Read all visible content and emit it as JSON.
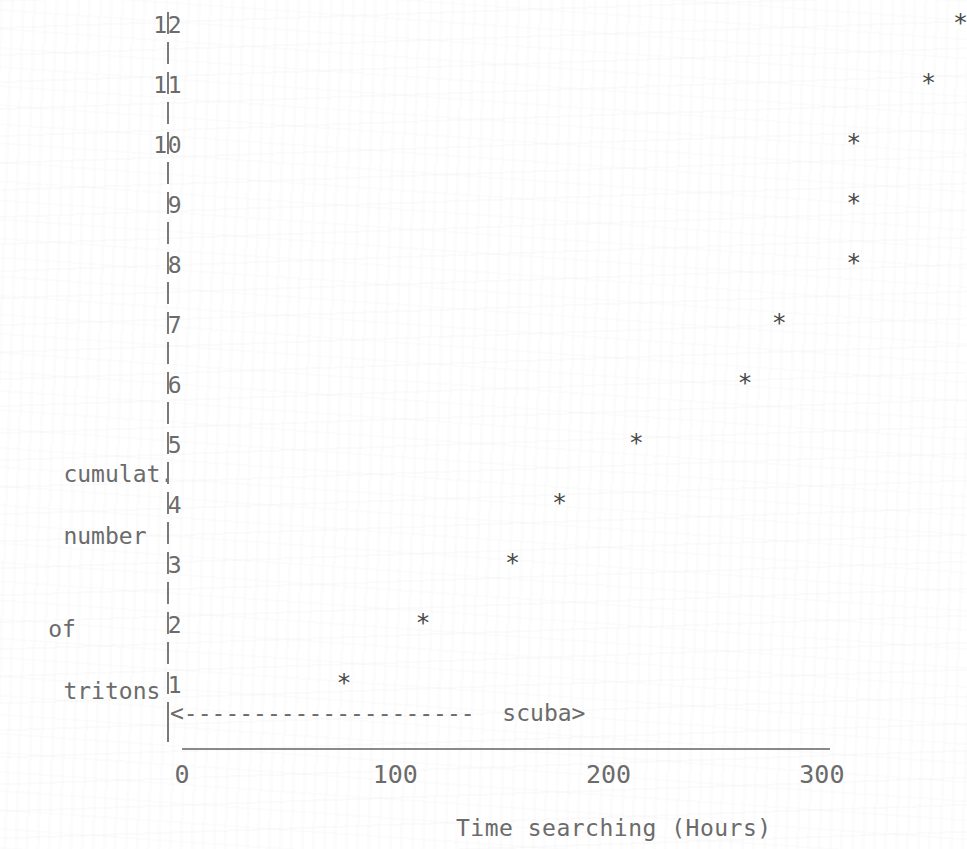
{
  "figure": {
    "background_color": "#ffffff",
    "ink_color": "#6b6b6b",
    "marker_glyph": "*",
    "axis_glyph": "|"
  },
  "y_axis": {
    "title_lines": [
      "cumulat.",
      "number",
      "of",
      "tritons"
    ],
    "tick_labels": [
      "12",
      "11",
      "10",
      "9",
      "8",
      "7",
      "6",
      "5",
      "4",
      "3",
      "2",
      "1"
    ]
  },
  "x_axis": {
    "title": "Time searching (Hours)",
    "tick_labels": [
      "0",
      "100",
      "200",
      "300"
    ]
  },
  "annotation": {
    "arrow": "<---------------------",
    "label": "scuba>"
  },
  "chart_data": {
    "type": "scatter",
    "title": "",
    "xlabel": "Time searching (Hours)",
    "ylabel": "cumulat. number of tritons",
    "xlim": [
      0,
      365
    ],
    "ylim": [
      0,
      12.5
    ],
    "xticks": [
      0,
      100,
      200,
      300
    ],
    "yticks": [
      1,
      2,
      3,
      4,
      5,
      6,
      7,
      8,
      9,
      10,
      11,
      12
    ],
    "grid": false,
    "legend": null,
    "marker": "star",
    "annotations": [
      {
        "text": "<--------------------- scuba>",
        "meaning": "scuba searching period",
        "x_start": 0,
        "x_end": 215,
        "y": 0.45
      }
    ],
    "x": [
      76,
      113,
      155,
      177,
      213,
      264,
      280,
      315,
      315,
      315,
      350,
      365
    ],
    "y": [
      1,
      2,
      3,
      4,
      5,
      6,
      7,
      8,
      9,
      10,
      11,
      12
    ],
    "points": [
      {
        "x": 76,
        "y": 1
      },
      {
        "x": 113,
        "y": 2
      },
      {
        "x": 155,
        "y": 3
      },
      {
        "x": 177,
        "y": 4
      },
      {
        "x": 213,
        "y": 5
      },
      {
        "x": 264,
        "y": 6
      },
      {
        "x": 280,
        "y": 7
      },
      {
        "x": 315,
        "y": 8
      },
      {
        "x": 315,
        "y": 9
      },
      {
        "x": 315,
        "y": 10
      },
      {
        "x": 350,
        "y": 11
      },
      {
        "x": 365,
        "y": 12
      }
    ]
  },
  "layout": {
    "x_origin_px": 182,
    "x_scale_px_per_hour": 2.133,
    "y_base_px": 683,
    "y_scale_px_per_unit": 60,
    "axis_line_left_px": 182,
    "axis_line_right_px": 830,
    "axis_line_top_px": 748,
    "x_tick_label_y_px": 775,
    "x_title_left_px": 456,
    "x_title_y_px": 828,
    "scuba_left_px": 170,
    "scuba_y_px": 713,
    "y_title_top_px": 428,
    "pipe_left_px": 167
  }
}
